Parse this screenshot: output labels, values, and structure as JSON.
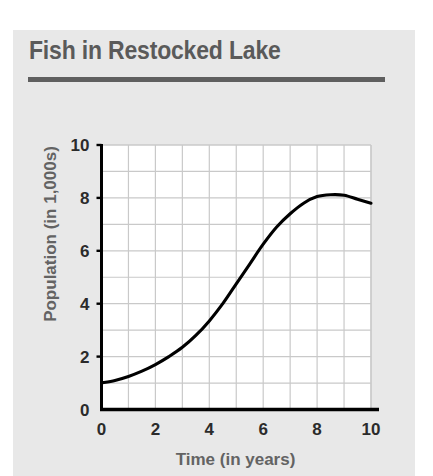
{
  "card": {
    "title": "Fish in Restocked Lake"
  },
  "chart_data": {
    "type": "line",
    "title": "Fish in Restocked Lake",
    "xlabel": "Time (in years)",
    "ylabel": "Population (in 1,000s)",
    "xlim": [
      0,
      10
    ],
    "ylim": [
      0,
      10
    ],
    "xticks": [
      0,
      2,
      4,
      6,
      8,
      10
    ],
    "yticks": [
      0,
      2,
      4,
      6,
      8,
      10
    ],
    "xtick_labels": [
      "0",
      "2",
      "4",
      "6",
      "8",
      "10"
    ],
    "ytick_labels": [
      "0",
      "2",
      "4",
      "6",
      "8",
      "10"
    ],
    "grid": true,
    "grid_step_x": 1,
    "grid_step_y": 1,
    "legend": "none",
    "line_color": "#000000",
    "grid_color": "#c9c9c9",
    "plot_background": "#ffffff",
    "panel_background": "#e8e8e8",
    "series": [
      {
        "name": "Fish population",
        "x": [
          0,
          0.5,
          1,
          1.5,
          2,
          2.5,
          3,
          3.5,
          4,
          4.5,
          5,
          5.5,
          6,
          6.5,
          7,
          7.5,
          8,
          8.5,
          9,
          9.5,
          10
        ],
        "values": [
          1.0,
          1.1,
          1.25,
          1.45,
          1.7,
          2.0,
          2.35,
          2.8,
          3.35,
          4.0,
          4.75,
          5.5,
          6.25,
          6.9,
          7.4,
          7.8,
          8.05,
          8.12,
          8.1,
          7.95,
          7.8
        ]
      }
    ]
  }
}
